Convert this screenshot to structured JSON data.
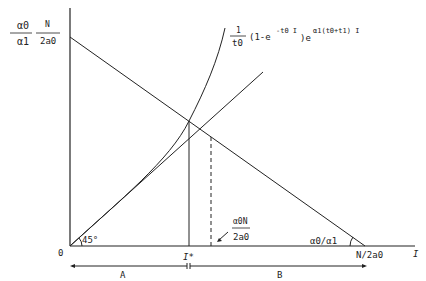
{
  "diagram": {
    "y_axis_label_left": {
      "num": "α0",
      "den": "α1"
    },
    "y_axis_label_right": {
      "num": "N",
      "den": "2a0"
    },
    "curve_label": {
      "frac_num": "1",
      "frac_den": "t0",
      "body": "(1-e",
      "exp1": "-t0 I",
      "mid": ")e",
      "exp2": "α1(t0+t1) I"
    },
    "origin_label": "0",
    "angle_label": "45°",
    "istar_label": "I*",
    "mid_label": {
      "num": "α0N",
      "den": "2a0"
    },
    "slope_label": "α0/α1",
    "x_intercept_label": "N/2a0",
    "x_axis_label": "I",
    "segment_a_label": "A",
    "segment_b_label": "B",
    "colors": {
      "line": "#222222",
      "background": "#ffffff"
    }
  }
}
